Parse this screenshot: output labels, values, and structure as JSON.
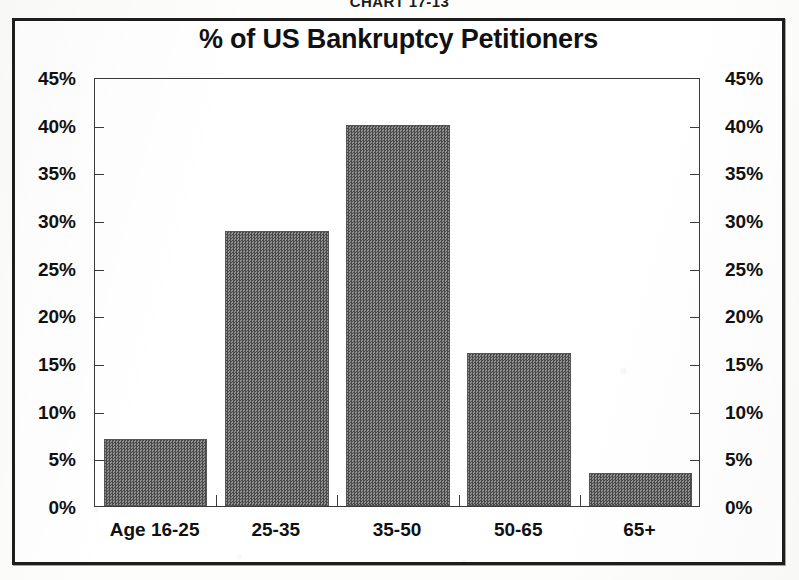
{
  "caption": {
    "prefix": "C",
    "word": "HART",
    "number": " 17-13",
    "full": "CHART 17-13"
  },
  "chart_data": {
    "type": "bar",
    "title": "% of US Bankruptcy Petitioners",
    "xlabel": "",
    "ylabel": "",
    "categories": [
      "Age 16-25",
      "25-35",
      "35-50",
      "50-65",
      "65+"
    ],
    "values": [
      7,
      28.8,
      40,
      16,
      3.5
    ],
    "value_labels": [
      "7%",
      "29%",
      "40%",
      "16%",
      "3.5%"
    ],
    "ylim": [
      0,
      45
    ],
    "ytick_values": [
      0,
      5,
      10,
      15,
      20,
      25,
      30,
      35,
      40,
      45
    ],
    "ytick_labels": [
      "0%",
      "5%",
      "10%",
      "15%",
      "20%",
      "25%",
      "30%",
      "35%",
      "40%",
      "45%"
    ],
    "ytick_labels_right": [
      "0%",
      "5%",
      "10%",
      "15%",
      "20%",
      "25%",
      "30%",
      "35%",
      "40%",
      "45%"
    ],
    "grid": false,
    "legend": false,
    "dual_axis": true,
    "bar_color": "#6e6e6e",
    "bar_edge_color": "#565656",
    "axis_color": "#3a3a3a",
    "text_color": "#111111",
    "background": "#ffffff"
  }
}
